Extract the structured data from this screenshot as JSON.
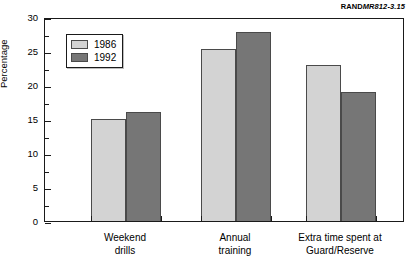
{
  "source_tag": {
    "brand": "RAND",
    "code": "MR812-3.15"
  },
  "chart_data": {
    "type": "bar",
    "title": "",
    "xlabel": "",
    "ylabel": "Percentage",
    "ylim": [
      0,
      30
    ],
    "ytick_step": 5,
    "yticks": [
      "0",
      "5",
      "10",
      "15",
      "20",
      "25",
      "30"
    ],
    "minor_tick_step": 2.5,
    "grid": false,
    "legend_position": "upper-left-inside",
    "categories": [
      "Weekend\ndrills",
      "Annual\ntraining",
      "Extra time spent at\nGuard/Reserve"
    ],
    "series": [
      {
        "name": "1986",
        "color": "#d3d3d3",
        "values": [
          15.0,
          25.3,
          23.0
        ]
      },
      {
        "name": "1992",
        "color": "#767676",
        "values": [
          16.0,
          27.8,
          19.0
        ]
      }
    ]
  }
}
